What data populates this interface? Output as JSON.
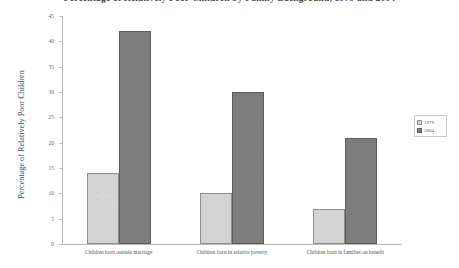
{
  "chart_data": {
    "type": "bar",
    "title": "Percentage of Relatively Poor Children by Family Background, 1979 and 2004",
    "xlabel": "",
    "ylabel": "Percentage of Relatively Poor Children",
    "categories": [
      "Children born outside marriage",
      "Children born in relative poverty",
      "Children born in families on benefit"
    ],
    "series": [
      {
        "name": "1979",
        "color": "#d4d4d4",
        "values": [
          14,
          10,
          7
        ]
      },
      {
        "name": "2004",
        "color": "#7d7d7d",
        "values": [
          42,
          30,
          21
        ]
      }
    ],
    "ylim": [
      0,
      45
    ],
    "yticks": [
      0,
      5,
      10,
      15,
      20,
      25,
      30,
      35,
      40,
      45
    ],
    "ytick_labels": [
      "0",
      "5",
      "10",
      "15",
      "20",
      "25",
      "30",
      "35",
      "40",
      "45"
    ],
    "grid": false,
    "legend_position": "right"
  }
}
